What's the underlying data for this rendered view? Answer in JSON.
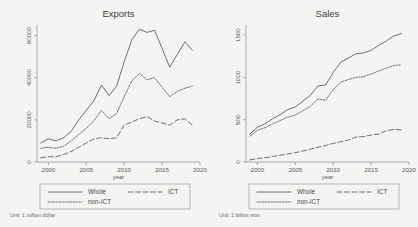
{
  "figure": {
    "background": "#f4f4f2",
    "line_color": "#555555"
  },
  "chart_data": [
    {
      "type": "line",
      "title": "Exports",
      "xlabel": "year",
      "ylabel": "",
      "note": "Unit: 1 million dollar",
      "xlim": [
        1998.5,
        2020
      ],
      "ylim": [
        0,
        65000
      ],
      "xticks": [
        2000,
        2005,
        2010,
        2015,
        2020
      ],
      "xtick_labels": [
        "2000",
        "2005",
        "2010",
        "2015",
        "2020"
      ],
      "yticks": [
        0,
        20000,
        40000,
        60000
      ],
      "ytick_labels": [
        "0",
        "20000",
        "40000",
        "60000"
      ],
      "grid": false,
      "legend_position": "below",
      "x": [
        1999,
        2000,
        2001,
        2002,
        2003,
        2004,
        2005,
        2006,
        2007,
        2008,
        2009,
        2010,
        2011,
        2012,
        2013,
        2014,
        2015,
        2016,
        2017,
        2018,
        2019
      ],
      "series": [
        {
          "name": "Whole",
          "style": "solid",
          "values": [
            9000,
            11000,
            10000,
            11500,
            14500,
            20000,
            24500,
            29000,
            36500,
            31500,
            36000,
            47500,
            58000,
            63000,
            61500,
            62500,
            54000,
            45000,
            51000,
            57000,
            53000
          ]
        },
        {
          "name": "ICT",
          "style": "longdash",
          "values": [
            2000,
            2500,
            2500,
            3500,
            5000,
            7000,
            9000,
            11000,
            11500,
            11000,
            11500,
            17500,
            19000,
            20500,
            21500,
            19500,
            18500,
            17500,
            20000,
            20500,
            17500
          ]
        },
        {
          "name": "non-ICT",
          "style": "dotted",
          "values": [
            6500,
            7000,
            6500,
            7500,
            10000,
            13000,
            16000,
            19500,
            24500,
            20500,
            23000,
            31000,
            38500,
            42000,
            39000,
            40000,
            35500,
            31000,
            33500,
            35000,
            36000
          ]
        }
      ]
    },
    {
      "type": "line",
      "title": "Sales",
      "xlabel": "year",
      "ylabel": "",
      "note": "Unit: 1 billion won",
      "xlim": [
        1998.5,
        2020
      ],
      "ylim": [
        0,
        1620
      ],
      "xticks": [
        2000,
        2005,
        2010,
        2015,
        2020
      ],
      "xtick_labels": [
        "2000",
        "2005",
        "2010",
        "2015",
        "2020"
      ],
      "yticks": [
        0,
        500,
        1000,
        1500
      ],
      "ytick_labels": [
        "0",
        "500",
        "1000",
        "1500"
      ],
      "grid": false,
      "legend_position": "below",
      "x": [
        1999,
        2000,
        2001,
        2002,
        2003,
        2004,
        2005,
        2006,
        2007,
        2008,
        2009,
        2010,
        2011,
        2012,
        2013,
        2014,
        2015,
        2016,
        2017,
        2018,
        2019
      ],
      "series": [
        {
          "name": "Whole",
          "style": "solid",
          "values": [
            330,
            410,
            450,
            510,
            560,
            620,
            650,
            720,
            790,
            900,
            910,
            1060,
            1180,
            1230,
            1280,
            1290,
            1320,
            1380,
            1430,
            1490,
            1520
          ]
        },
        {
          "name": "ICT",
          "style": "longdash",
          "values": [
            25,
            40,
            50,
            65,
            80,
            95,
            110,
            130,
            150,
            175,
            195,
            220,
            240,
            260,
            295,
            300,
            320,
            330,
            370,
            385,
            380
          ]
        },
        {
          "name": "non-ICT",
          "style": "dotted",
          "values": [
            305,
            375,
            405,
            450,
            490,
            530,
            555,
            605,
            660,
            745,
            730,
            855,
            945,
            975,
            1000,
            1010,
            1040,
            1075,
            1110,
            1140,
            1150
          ]
        }
      ]
    }
  ],
  "legend": {
    "entries": [
      {
        "label": "Whole",
        "style": "solid"
      },
      {
        "label": "ICT",
        "style": "longdash"
      },
      {
        "label": "non-ICT",
        "style": "dotted"
      }
    ]
  }
}
